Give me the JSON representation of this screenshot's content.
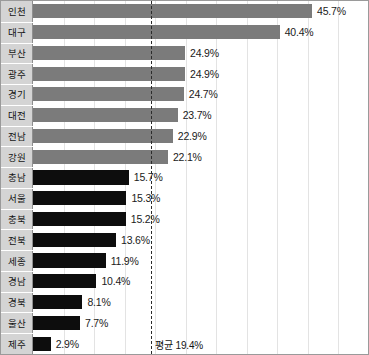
{
  "chart_data": {
    "type": "bar",
    "orientation": "horizontal",
    "title": "",
    "xlabel": "",
    "ylabel": "",
    "categories": [
      "인천",
      "대구",
      "부산",
      "광주",
      "경기",
      "대전",
      "전남",
      "강원",
      "충남",
      "서울",
      "충북",
      "전북",
      "세종",
      "경남",
      "경북",
      "울산",
      "제주"
    ],
    "values": [
      45.7,
      40.4,
      24.9,
      24.9,
      24.7,
      23.7,
      22.9,
      22.1,
      15.7,
      15.3,
      15.2,
      13.6,
      11.9,
      10.4,
      8.1,
      7.7,
      2.9
    ],
    "value_labels": [
      "45.7%",
      "40.4%",
      "24.9%",
      "24.9%",
      "24.7%",
      "23.7%",
      "22.9%",
      "22.1%",
      "15.7%",
      "15.3%",
      "15.2%",
      "13.6%",
      "11.9%",
      "10.4%",
      "8.1%",
      "7.7%",
      "2.9%"
    ],
    "bar_colors": [
      "#7b7b7b",
      "#7b7b7b",
      "#7b7b7b",
      "#7b7b7b",
      "#7b7b7b",
      "#7b7b7b",
      "#7b7b7b",
      "#7b7b7b",
      "#0d0d0d",
      "#0d0d0d",
      "#0d0d0d",
      "#0d0d0d",
      "#0d0d0d",
      "#0d0d0d",
      "#0d0d0d",
      "#0d0d0d",
      "#0d0d0d"
    ],
    "xlim": [
      0,
      55
    ],
    "grid": true,
    "legend": "none",
    "annotations": [
      {
        "name": "average-line",
        "label": "평균 19.4%",
        "value": 19.4,
        "style": "dashed"
      }
    ]
  },
  "colors": {
    "above_average_bar": "#7b7b7b",
    "below_average_bar": "#0d0d0d",
    "category_column_bg": "#d4d4d4",
    "gridline": "#e3e3e3",
    "frame": "#9a9a9a",
    "average_line": "#2b2b2b"
  }
}
